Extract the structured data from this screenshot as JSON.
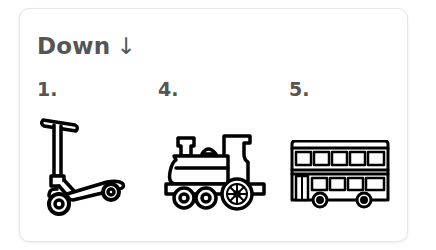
{
  "section": {
    "title": "Down",
    "direction_icon": "arrow-down-icon",
    "direction_glyph": "↓"
  },
  "clues": [
    {
      "number": "1.",
      "icon": "kick-scooter-icon"
    },
    {
      "number": "4.",
      "icon": "locomotive-icon"
    },
    {
      "number": "5.",
      "icon": "double-decker-bus-icon"
    }
  ],
  "colors": {
    "text": "#555555",
    "icon_stroke": "#000000",
    "card_border": "#e6e6e6",
    "background": "#ffffff"
  }
}
